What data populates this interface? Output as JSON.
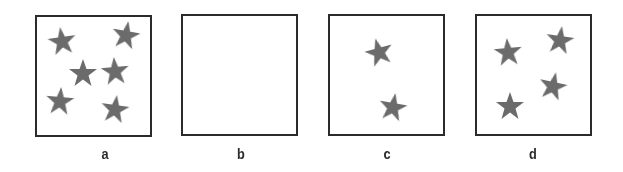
{
  "colors": {
    "star": "#6b6b6b",
    "border": "#2b2b2b",
    "background": "#ffffff"
  },
  "panels": [
    {
      "label": "a",
      "box": [
        35,
        15,
        117,
        122
      ],
      "stars": [
        [
          62,
          41,
          -8
        ],
        [
          126,
          35,
          10
        ],
        [
          83,
          73,
          0
        ],
        [
          115,
          71,
          -5
        ],
        [
          60,
          101,
          5
        ],
        [
          115,
          109,
          8
        ]
      ]
    },
    {
      "label": "b",
      "box": [
        181,
        14,
        117,
        122
      ],
      "stars": []
    },
    {
      "label": "c",
      "box": [
        328,
        14,
        117,
        122
      ],
      "stars": [
        [
          379,
          52,
          -15
        ],
        [
          393,
          107,
          10
        ]
      ]
    },
    {
      "label": "d",
      "box": [
        475,
        14,
        117,
        122
      ],
      "stars": [
        [
          508,
          52,
          -5
        ],
        [
          560,
          40,
          8
        ],
        [
          553,
          86,
          12
        ],
        [
          510,
          106,
          0
        ]
      ]
    }
  ]
}
